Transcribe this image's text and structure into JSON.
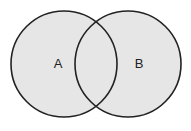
{
  "diagram": {
    "type": "venn",
    "sets": [
      {
        "label": "A",
        "cx": 64,
        "cy": 64,
        "r": 53
      },
      {
        "label": "B",
        "cx": 128,
        "cy": 64,
        "r": 53
      }
    ],
    "fill_color": "#e6e6e6",
    "stroke_color": "#222222"
  }
}
